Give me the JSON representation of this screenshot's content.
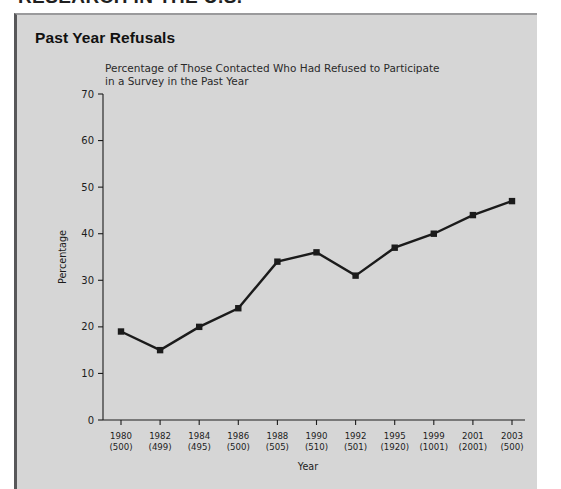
{
  "page": {
    "cut_off_heading": "RESEARCH IN THE U.S."
  },
  "panel": {
    "title": "Past Year Refusals"
  },
  "chart_data": {
    "type": "line",
    "title": "Percentage of Those Contacted Who Had Refused to Participate in a Survey in the Past Year",
    "subtitle_line1": "Percentage of Those Contacted Who Had Refused to Participate",
    "subtitle_line2": "in a Survey in the Past Year",
    "xlabel": "Year",
    "ylabel": "Percentage",
    "ylim": [
      0,
      70
    ],
    "yticks": [
      0,
      10,
      20,
      30,
      40,
      50,
      60,
      70
    ],
    "grid": false,
    "legend": null,
    "marker": "square",
    "line_color": "#1b1b1b",
    "marker_color": "#1b1b1b",
    "categories": [
      "1980",
      "1982",
      "1984",
      "1986",
      "1988",
      "1990",
      "1992",
      "1995",
      "1999",
      "2001",
      "2003"
    ],
    "sample_sizes": [
      500,
      499,
      495,
      500,
      505,
      510,
      501,
      1920,
      1001,
      2001,
      500
    ],
    "tick_labels": [
      {
        "year": "1980",
        "n": "(500)"
      },
      {
        "year": "1982",
        "n": "(499)"
      },
      {
        "year": "1984",
        "n": "(495)"
      },
      {
        "year": "1986",
        "n": "(500)"
      },
      {
        "year": "1988",
        "n": "(505)"
      },
      {
        "year": "1990",
        "n": "(510)"
      },
      {
        "year": "1992",
        "n": "(501)"
      },
      {
        "year": "1995",
        "n": "(1920)"
      },
      {
        "year": "1999",
        "n": "(1001)"
      },
      {
        "year": "2001",
        "n": "(2001)"
      },
      {
        "year": "2003",
        "n": "(500)"
      }
    ],
    "values": [
      19,
      15,
      20,
      24,
      34,
      36,
      31,
      37,
      40,
      44,
      47
    ]
  }
}
